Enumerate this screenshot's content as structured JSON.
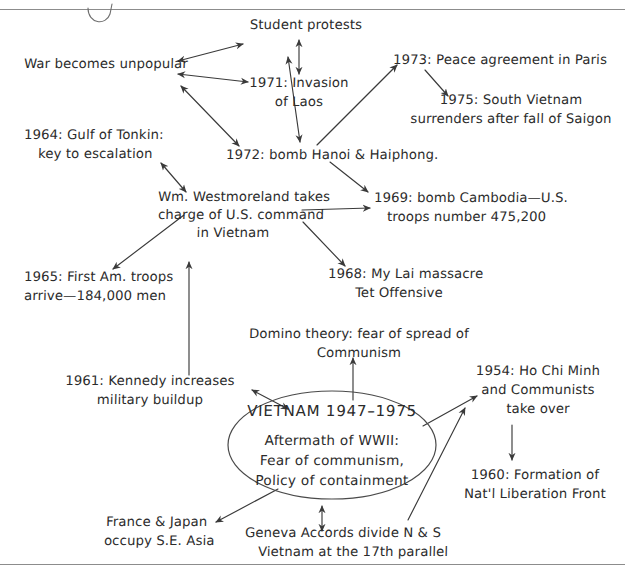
{
  "page": {
    "ink_color": "#2b2b2b",
    "rule_color": "#8c8c8c",
    "background": "#ffffff"
  },
  "center": {
    "heading": "VIETNAM 1947–1975",
    "body_line1": "Aftermath of WWII:",
    "body_line2": "Fear of communism,",
    "body_line3": "Policy of containment"
  },
  "nodes": {
    "war_unpopular": "War becomes unpopular",
    "student_protests": "Student protests",
    "invasion_laos_line1": "1971: Invasion",
    "invasion_laos_line2": "of Laos",
    "peace_paris": "1973: Peace agreement in Paris",
    "saigon_line1": "1975: South Vietnam",
    "saigon_line2": "surrenders after fall of Saigon",
    "tonkin_line1": "1964: Gulf of Tonkin:",
    "tonkin_line2": "key to escalation",
    "bomb_hanoi": "1972: bomb Hanoi & Haiphong.",
    "westmoreland_line1": "Wm. Westmoreland takes",
    "westmoreland_line2": "charge of U.S. command",
    "westmoreland_line3": "in Vietnam",
    "cambodia_line1": "1969: bomb Cambodia—U.S.",
    "cambodia_line2": "troops number 475,200",
    "first_troops_line1": "1965: First Am. troops",
    "first_troops_line2": "arrive—184,000 men",
    "mylai_line1": "1968: My Lai massacre",
    "mylai_line2": "Tet Offensive",
    "domino_line1": "Domino theory: fear of spread of",
    "domino_line2": "Communism",
    "kennedy_line1": "1961: Kennedy increases",
    "kennedy_line2": "military buildup",
    "hochiminh_line1": "1954: Ho Chi Minh",
    "hochiminh_line2": "and Communists",
    "hochiminh_line3": "take over",
    "nlf_line1": "1960: Formation of",
    "nlf_line2": "Nat'l Liberation Front",
    "france_japan_line1": "France & Japan",
    "france_japan_line2": "occupy S.E. Asia",
    "geneva_line1": "Geneva Accords divide N & S",
    "geneva_line2": "Vietnam at the 17th parallel"
  }
}
